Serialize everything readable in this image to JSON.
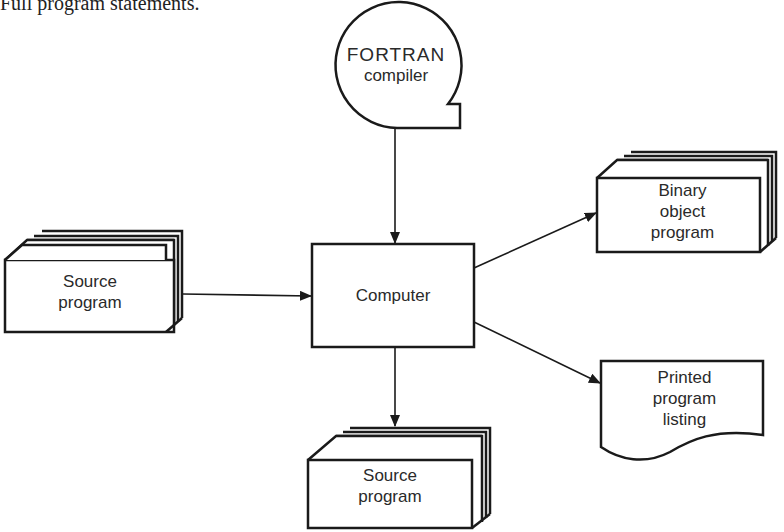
{
  "caption": "Full program statements.",
  "nodes": {
    "compiler": {
      "line1": "FORTRAN",
      "line2": "compiler"
    },
    "source_in": {
      "line1": "Source",
      "line2": "program"
    },
    "computer": {
      "label": "Computer"
    },
    "binary": {
      "line1": "Binary",
      "line2": "object",
      "line3": "program"
    },
    "listing": {
      "line1": "Printed",
      "line2": "program",
      "line3": "listing"
    },
    "source_out": {
      "line1": "Source",
      "line2": "program"
    }
  },
  "colors": {
    "stroke": "#1a1a1a",
    "background": "#ffffff"
  }
}
